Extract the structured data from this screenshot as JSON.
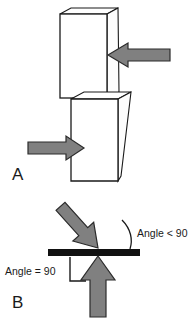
{
  "figure": {
    "background_color": "#ffffff",
    "outline_color": "#1a1a1a",
    "arrow_fill_color": "#808080",
    "arrow_stroke_color": "#1a1a1a",
    "bar_color": "#111111"
  },
  "panels": [
    {
      "id": "A",
      "label": "A",
      "description": "Two stacked 3D blocks with opposing horizontal arrows forming a shear couple",
      "blocks": [
        {
          "name": "upper-block",
          "position": "top",
          "shading": "white-face"
        },
        {
          "name": "lower-block",
          "position": "bottom",
          "shading": "white-face"
        }
      ],
      "arrows": [
        {
          "name": "upper-arrow",
          "direction": "left",
          "target": "upper-block"
        },
        {
          "name": "lower-arrow",
          "direction": "right",
          "target": "lower-block"
        }
      ]
    },
    {
      "id": "B",
      "label": "B",
      "description": "Horizontal surface with an oblique arrow and a perpendicular arrow, annotated with angles",
      "surface": {
        "name": "horizontal-bar",
        "orientation": "horizontal"
      },
      "arrows": [
        {
          "name": "oblique-arrow",
          "direction": "down-left",
          "angle_to_surface": "less than 90"
        },
        {
          "name": "perpendicular-arrow",
          "direction": "up",
          "angle_to_surface": "90"
        }
      ],
      "annotations": [
        {
          "name": "angle-less-than-90-label",
          "text": "Angle < 90",
          "marker": "arc"
        },
        {
          "name": "angle-equals-90-label",
          "text": "Angle = 90",
          "marker": "right-angle-square"
        }
      ]
    }
  ],
  "labels": {
    "panel_a": "A",
    "panel_b": "B",
    "angle_lt_90": "Angle < 90",
    "angle_eq_90": "Angle = 90"
  }
}
